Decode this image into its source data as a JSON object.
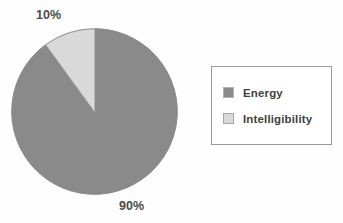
{
  "chart_data": {
    "type": "pie",
    "title": "",
    "categories": [
      "Energy",
      "Intelligibility"
    ],
    "values": [
      90,
      10
    ],
    "data_labels": [
      "90%",
      "10%"
    ],
    "colors": [
      "#8a8a8a",
      "#d9d9d9"
    ],
    "legend_position": "right",
    "grid": false,
    "units": "percent",
    "start_angle_deg": 0,
    "slices": [
      {
        "label": "Energy",
        "value": 90,
        "data_label": "90%",
        "color": "#8a8a8a",
        "direction": "clockwise-from-top"
      },
      {
        "label": "Intelligibility",
        "value": 10,
        "data_label": "10%",
        "color": "#d9d9d9",
        "direction": "counterclockwise-from-top"
      }
    ]
  },
  "labels": {
    "intelligibility_pct": "10%",
    "energy_pct": "90%"
  },
  "legend": {
    "items": [
      {
        "label": "Energy",
        "swatch": "dark-gray-swatch",
        "color": "#8a8a8a"
      },
      {
        "label": "Intelligibility",
        "swatch": "light-gray-swatch",
        "color": "#d9d9d9"
      }
    ]
  }
}
